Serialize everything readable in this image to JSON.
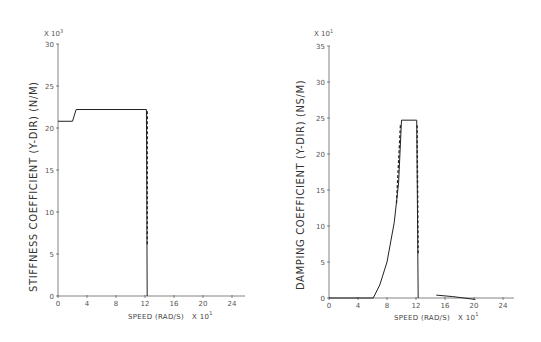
{
  "chart_data": [
    {
      "type": "line",
      "title": "",
      "multiplier_y": "X 10^3",
      "ylabel": "STIFFNESS COEFFICIENT (Y-DIR) (N/M)",
      "xlabel": "SPEED (RAD/S)",
      "multiplier_x": "X 10^1",
      "xlim": [
        0,
        26
      ],
      "ylim": [
        0,
        30
      ],
      "x_ticks": [
        0,
        4,
        8,
        12,
        16,
        20,
        24
      ],
      "y_ticks": [
        0,
        5,
        10,
        15,
        20,
        25,
        30
      ],
      "grid": false,
      "series": [
        {
          "name": "stiffness",
          "style": "solid",
          "x": [
            0,
            2.0,
            2.5,
            12.2,
            12.3
          ],
          "y": [
            20.8,
            20.8,
            22.2,
            22.2,
            0
          ]
        }
      ]
    },
    {
      "type": "line",
      "title": "",
      "multiplier_y": "X 10^1",
      "ylabel": "DAMPING COEFFICIENT (Y-DIR) (NS/M)",
      "xlabel": "SPEED (RAD/S)",
      "multiplier_x": "X 10^1",
      "xlim": [
        0,
        26
      ],
      "ylim": [
        0,
        35
      ],
      "x_ticks": [
        0,
        4,
        8,
        12,
        16,
        20,
        24
      ],
      "y_ticks": [
        0,
        5,
        10,
        15,
        20,
        25,
        30,
        35
      ],
      "grid": false,
      "series": [
        {
          "name": "damping",
          "style": "solid",
          "x": [
            0,
            6.1,
            7.0,
            8.0,
            9.0,
            9.6,
            10.0,
            12.1,
            12.3
          ],
          "y": [
            0,
            0,
            1.8,
            5.0,
            10.5,
            16.0,
            24.7,
            24.7,
            0
          ]
        },
        {
          "name": "damping-tail",
          "style": "solid",
          "x": [
            14.8,
            17.0,
            20.2
          ],
          "y": [
            0.4,
            0.2,
            -0.2
          ]
        }
      ]
    }
  ],
  "left_chart": {
    "multiplier_base": "X 10",
    "multiplier_exp": "3",
    "ylabel": "STIFFNESS  COEFFICIENT (Y-DIR) (N/M)",
    "xlabel": "SPEED (RAD/S)",
    "x_multiplier_base": "X 10",
    "x_multiplier_exp": "1"
  },
  "right_chart": {
    "multiplier_base": "X 10",
    "multiplier_exp": "1",
    "ylabel": "DAMPING  COEFFICIENT (Y-DIR)  (NS/M)",
    "xlabel": "SPEED (RAD/S)",
    "x_multiplier_base": "X 10",
    "x_multiplier_exp": "1"
  }
}
